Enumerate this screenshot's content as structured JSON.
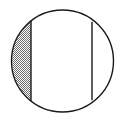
{
  "figure": {
    "name": "circle-with-shaded-segment",
    "background_color": "#FFFFFF",
    "canvas": {
      "width": 127,
      "height": 120
    },
    "circle": {
      "name": "outline-circle",
      "center_x": 62.5,
      "center_y": 61.0,
      "radius": 51.0,
      "stroke_color": "#1A1A1A",
      "stroke_width": 1.4,
      "fill": "none"
    },
    "chords": [
      {
        "name": "left-chord",
        "orientation": "vertical",
        "x": 31.0,
        "y_top": 20.6,
        "y_bottom": 101.4,
        "stroke_color": "#1A1A1A",
        "stroke_width": 1.4
      },
      {
        "name": "right-chord",
        "orientation": "vertical",
        "x": 92.0,
        "y_top": 21.8,
        "y_bottom": 100.2,
        "stroke_color": "#1A1A1A",
        "stroke_width": 1.4
      }
    ],
    "regions": [
      {
        "name": "left-segment-shaded",
        "position": "left",
        "fill_style": "gray-halftone-dither",
        "fill_color": "#858585",
        "shaded": true,
        "bounded_by": [
          "circle-left-arc",
          "left-chord"
        ]
      },
      {
        "name": "middle-band-unshaded",
        "position": "middle",
        "fill_style": "none",
        "fill_color": "#FFFFFF",
        "shaded": false,
        "bounded_by": [
          "left-chord",
          "right-chord"
        ]
      },
      {
        "name": "right-segment-unshaded",
        "position": "right",
        "fill_style": "none",
        "fill_color": "#FFFFFF",
        "shaded": false,
        "bounded_by": [
          "right-chord",
          "circle-right-arc"
        ]
      }
    ]
  }
}
